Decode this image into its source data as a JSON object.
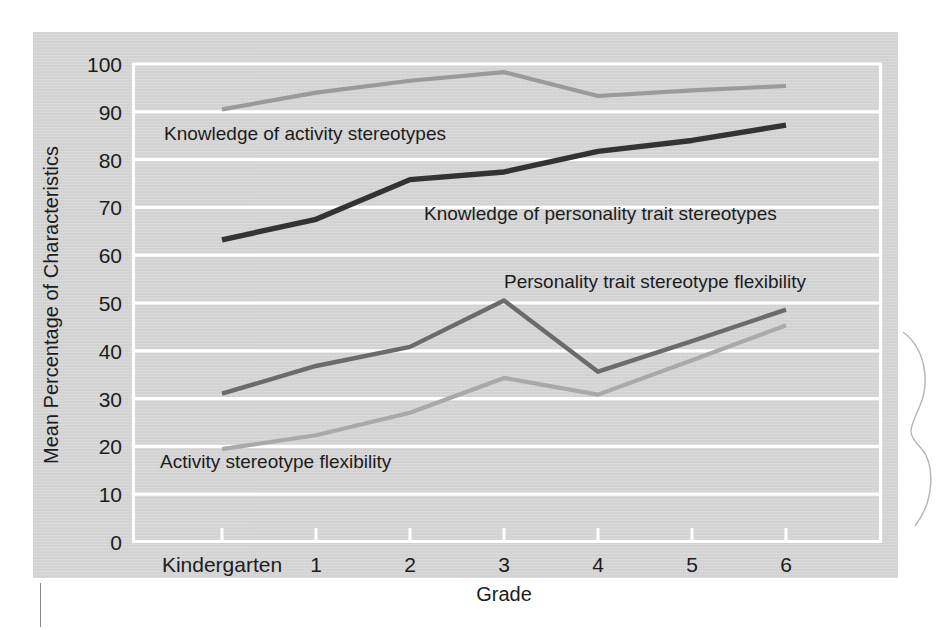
{
  "figure": {
    "panel_color": "#d5d5d5",
    "gridline_color": "#ffffff",
    "text_color": "#1c1c1c"
  },
  "chart_data": {
    "type": "line",
    "title": "",
    "xlabel": "Grade",
    "ylabel": "Mean Percentage of Characteristics",
    "categories": [
      "Kindergarten",
      "1",
      "2",
      "3",
      "4",
      "5",
      "6"
    ],
    "x": [
      0,
      1,
      2,
      3,
      4,
      5,
      6
    ],
    "ylim": [
      0,
      100
    ],
    "yticks": [
      0,
      10,
      20,
      30,
      40,
      50,
      60,
      70,
      80,
      90,
      100
    ],
    "ytick_labels": [
      "0",
      "10",
      "20",
      "30",
      "40",
      "50",
      "60",
      "70",
      "80",
      "90",
      "100"
    ],
    "grid": "horizontal",
    "legend": "inline-labels",
    "series": [
      {
        "name": "Knowledge of activity stereotypes",
        "color": "#9a9a9a",
        "values": [
          90.5,
          94.0,
          96.5,
          98.3,
          93.3,
          94.5,
          95.4
        ],
        "label_x_category": "1",
        "label_y": 85.5
      },
      {
        "name": "Knowledge of personality trait stereotypes",
        "color": "#333333",
        "values": [
          63.2,
          67.5,
          75.8,
          77.4,
          81.7,
          84.0,
          87.2
        ],
        "label_x_category": "3",
        "label_y": 71.0
      },
      {
        "name": "Personality trait stereotype flexibility",
        "color": "#6b6b6b",
        "values": [
          31.0,
          36.8,
          40.8,
          50.5,
          35.6,
          42.0,
          48.6
        ],
        "label_x_category": "4",
        "label_y": 56.5
      },
      {
        "name": "Activity stereotype flexibility",
        "color": "#a9a9a9",
        "values": [
          19.4,
          22.3,
          27.0,
          34.3,
          30.8,
          38.0,
          45.3
        ],
        "label_x_category": "1",
        "label_y": 15.5
      }
    ]
  }
}
